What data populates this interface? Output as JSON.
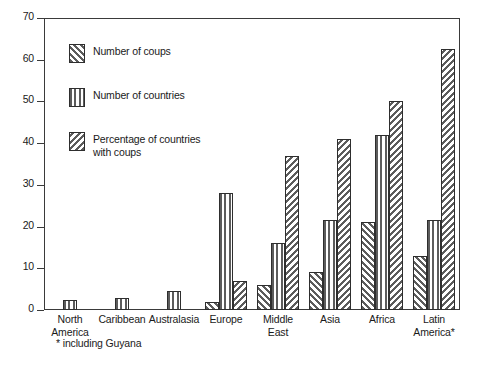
{
  "chart_data": {
    "type": "bar",
    "title": "",
    "xlabel": "",
    "ylabel": "",
    "ylim": [
      0,
      70
    ],
    "yticks": [
      0,
      10,
      20,
      30,
      40,
      50,
      60,
      70
    ],
    "ytick_labels": [
      "0",
      "10",
      "20",
      "30",
      "40",
      "50",
      "60",
      "70"
    ],
    "grid": false,
    "legend_position": "upper-left-inside",
    "categories": [
      "North\nAmerica",
      "Caribbean",
      "Australasia",
      "Europe",
      "Middle East",
      "Asia",
      "Africa",
      "Latin\nAmerica*"
    ],
    "series": [
      {
        "name": "Number of coups",
        "pattern": "forward-diagonal",
        "values": [
          0,
          0,
          0,
          2,
          6,
          9,
          21,
          13
        ]
      },
      {
        "name": "Number of countries",
        "pattern": "vertical-stripes",
        "values": [
          2.5,
          3,
          4.5,
          28,
          16,
          21.5,
          42,
          21.5
        ]
      },
      {
        "name": "Percentage of countries\nwith coups",
        "pattern": "backward-diagonal",
        "values": [
          0,
          0,
          0,
          7,
          37,
          41,
          50,
          62.5
        ]
      }
    ],
    "footnote": "* including Guyana",
    "colors": {
      "axis": "#3a3a3a",
      "hatch": "#5c5c5c",
      "bar_border": "#2e2e2e",
      "background": "#ffffff",
      "text": "#1a1a1a"
    }
  },
  "legend": {
    "items": [
      {
        "label": "Number of coups",
        "pattern": "forward-diagonal"
      },
      {
        "label": "Number of countries",
        "pattern": "vertical-stripes"
      },
      {
        "label": "Percentage of countries\nwith coups",
        "pattern": "backward-diagonal"
      }
    ]
  },
  "footnote": {
    "text": "* including Guyana"
  }
}
